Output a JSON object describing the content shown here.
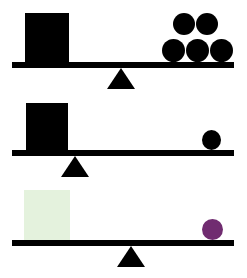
{
  "figure": {
    "background_color": "#ffffff",
    "width": 247,
    "height": 278
  },
  "colors": {
    "black": "#000000",
    "pale_green": "#e4f2dd",
    "purple": "#702c70",
    "white": "#ffffff"
  },
  "panels": [
    {
      "id": "panel-1",
      "name": "top-balance-scale",
      "fulcrum": {
        "label": "fulcrum",
        "position": "center",
        "x": 121
      },
      "beam": {
        "label": "beam",
        "tilt": "level"
      },
      "left_side": {
        "object": "square-block",
        "color_name": "black",
        "color": "#000000",
        "count": 1
      },
      "right_side": {
        "object": "circle-balls",
        "color_name": "black",
        "color": "#000000",
        "count": 5,
        "arrangement": "2 on top row, 3 on bottom row"
      }
    },
    {
      "id": "panel-2",
      "name": "middle-balance-scale",
      "fulcrum": {
        "label": "fulcrum",
        "position": "left-of-center",
        "x": 75
      },
      "beam": {
        "label": "beam",
        "tilt": "level"
      },
      "left_side": {
        "object": "square-block",
        "color_name": "black",
        "color": "#000000",
        "count": 1
      },
      "right_side": {
        "object": "circle-ball",
        "color_name": "black",
        "color": "#000000",
        "count": 1
      }
    },
    {
      "id": "panel-3",
      "name": "bottom-balance-scale",
      "fulcrum": {
        "label": "fulcrum",
        "position": "slightly-left-of-center",
        "x": 131
      },
      "beam": {
        "label": "beam",
        "tilt": "level"
      },
      "left_side": {
        "object": "square-block",
        "color_name": "pale green",
        "color": "#e4f2dd",
        "count": 1
      },
      "right_side": {
        "object": "circle-ball",
        "color_name": "purple",
        "color": "#702c70",
        "count": 1
      }
    }
  ]
}
